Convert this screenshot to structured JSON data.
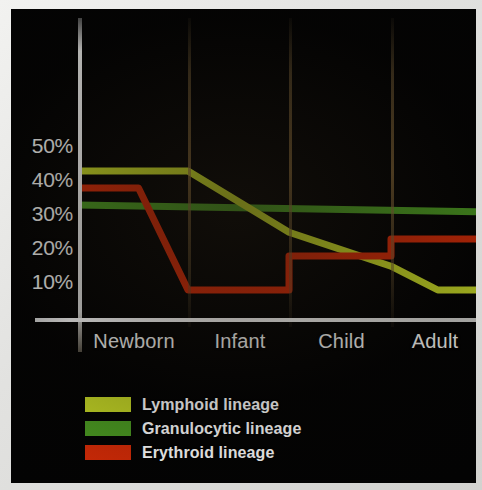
{
  "chart_data": {
    "type": "line",
    "title": "",
    "subtitle": "",
    "xlabel": "",
    "ylabel": "",
    "categories": [
      "Newborn",
      "Infant",
      "Child",
      "Adult"
    ],
    "ytick_labels": [
      "50%",
      "40%",
      "30%",
      "20%",
      "10%"
    ],
    "ytick_values": [
      50,
      40,
      30,
      20,
      10
    ],
    "ylim": [
      0,
      55
    ],
    "grid": "vertical-category-dividers",
    "legend_position": "bottom-left",
    "background": "#030303",
    "series": [
      {
        "name": "Lymphoid lineage",
        "color": "#c6d826",
        "values": [
          45,
          45,
          27,
          10
        ],
        "points": [
          {
            "stage": "Newborn",
            "position": "start",
            "value": 45
          },
          {
            "stage": "Newborn",
            "position": "end",
            "value": 45
          },
          {
            "stage": "Infant",
            "position": "end",
            "value": 27
          },
          {
            "stage": "Child",
            "position": "end",
            "value": 17
          },
          {
            "stage": "Adult",
            "position": "mid",
            "value": 10
          },
          {
            "stage": "Adult",
            "position": "end",
            "value": 10
          }
        ]
      },
      {
        "name": "Granulocytic lineage",
        "color": "#4b9a22",
        "values": [
          35,
          34,
          34,
          33
        ],
        "points": [
          {
            "stage": "Newborn",
            "position": "start",
            "value": 35
          },
          {
            "stage": "Adult",
            "position": "end",
            "value": 33
          }
        ]
      },
      {
        "name": "Erythroid lineage",
        "color": "#d42b07",
        "values": [
          40,
          10,
          20,
          25
        ],
        "points": [
          {
            "stage": "Newborn",
            "position": "start",
            "value": 40
          },
          {
            "stage": "Newborn",
            "position": "mid",
            "value": 40
          },
          {
            "stage": "Infant",
            "position": "start",
            "value": 10
          },
          {
            "stage": "Infant",
            "position": "end",
            "value": 10
          },
          {
            "stage": "Child",
            "position": "start",
            "value": 20
          },
          {
            "stage": "Child",
            "position": "end",
            "value": 20
          },
          {
            "stage": "Adult",
            "position": "start",
            "value": 25
          },
          {
            "stage": "Adult",
            "position": "end",
            "value": 25
          }
        ]
      }
    ]
  },
  "yticks": [
    {
      "label": "50%",
      "value": 50
    },
    {
      "label": "40%",
      "value": 40
    },
    {
      "label": "30%",
      "value": 30
    },
    {
      "label": "20%",
      "value": 20
    },
    {
      "label": "10%",
      "value": 10
    }
  ],
  "xticks": [
    {
      "label": "Newborn"
    },
    {
      "label": "Infant"
    },
    {
      "label": "Child"
    },
    {
      "label": "Adult"
    }
  ],
  "legend": [
    {
      "label": "Lymphoid lineage",
      "color": "#c6d826"
    },
    {
      "label": "Granulocytic lineage",
      "color": "#4b9a22"
    },
    {
      "label": "Erythroid lineage",
      "color": "#d42b07"
    }
  ]
}
